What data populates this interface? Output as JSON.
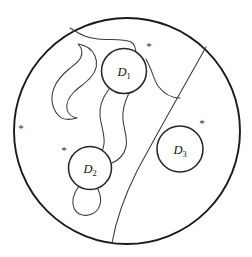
{
  "figure": {
    "kind": "mathematical-diagram",
    "background_color": "#ffffff",
    "line_color": "#1b1b1b",
    "outer_disk": {
      "name": "outer-boundary-circle",
      "cx": 127,
      "cy": 131,
      "r": 113
    },
    "subdomains": [
      {
        "id": "D1",
        "label": "D",
        "subscript": "1",
        "cx": 124,
        "cy": 71,
        "r": 22.5,
        "label_x": 124,
        "label_y": 76
      },
      {
        "id": "D2",
        "label": "D",
        "subscript": "2",
        "cx": 90,
        "cy": 168,
        "r": 21.5,
        "label_x": 90,
        "label_y": 173
      },
      {
        "id": "D3",
        "label": "D",
        "subscript": "3",
        "cx": 180,
        "cy": 149,
        "r": 23,
        "label_x": 180,
        "label_y": 154
      }
    ],
    "marks": [
      {
        "id": "mark-left",
        "glyph": "*",
        "x": 21,
        "y": 132
      },
      {
        "id": "mark-near-d1",
        "glyph": "*",
        "x": 149,
        "y": 50
      },
      {
        "id": "mark-near-d2",
        "glyph": "*",
        "x": 64,
        "y": 154
      },
      {
        "id": "mark-near-d3",
        "glyph": "*",
        "x": 202,
        "y": 127
      }
    ],
    "paths": {
      "big_arc": "M 206,47 C 186,83 160,128 137,171 C 125,195 116,220 112,243",
      "top_curve": "M 70,28 C 80,34 86,38 98,39 C 112,40 124,39 131,42 C 135,44 136,48 136,55",
      "upper_right_curve": "M 146,59 C 152,70 154,80 158,86 C 164,94 172,98 180,98",
      "hook_blob": "M 58,115 C 52,108 50,98 54,88 C 57,80 63,74 69,69 C 74,65 79,62 81,57 C 83,52 81,47 78,44 C 85,45 92,49 95,56 C 98,63 96,71 91,77 C 86,83 79,87 74,92 C 69,97 66,103 67,109 C 68,114 72,117 77,118 C 70,120 62,120 58,115 Z",
      "tube_left": "M 109,89 C 103,97 99,106 100,116 C 101,126 105,134 104,144 C 103,152 99,158 95,163",
      "tube_right": "M 129,93 C 125,101 122,110 123,120 C 124,130 128,138 126,147 C 124,155 119,160 112,163",
      "teardrop": "M 79,186 C 74,193 71,201 74,208 C 77,215 85,217 92,214 C 99,211 102,203 100,195 C 99,190 97,187 95,184"
    }
  }
}
